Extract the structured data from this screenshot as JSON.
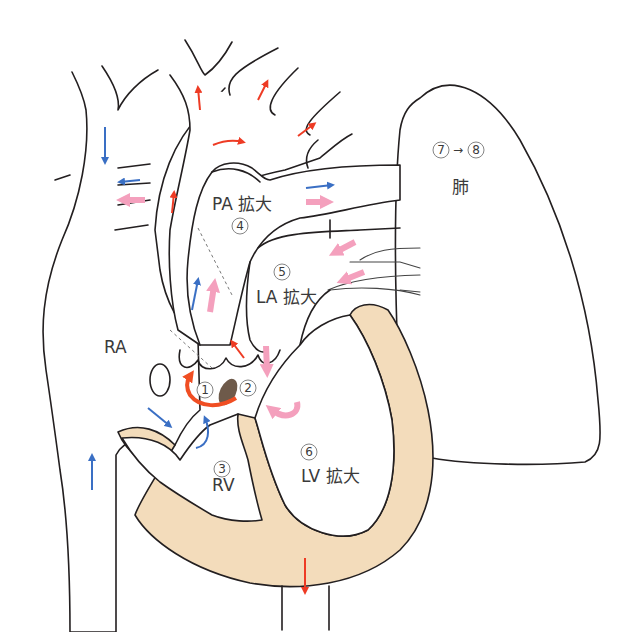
{
  "labels": {
    "ra": "RA",
    "pa": "PA 拡大",
    "la": "LA 拡大",
    "rv": "RV",
    "lv": "LV 拡大",
    "lung": "肺"
  },
  "markers": {
    "m1": "1",
    "m2": "2",
    "m3": "3",
    "m4": "4",
    "m5": "5",
    "m6": "6",
    "m7": "7",
    "m8": "8",
    "arrow": "→"
  },
  "colors": {
    "venous_blue": "#3a6fc4",
    "arterial_red": "#ee3b24",
    "shunt_pink": "#f4a0bd",
    "myocardium": "#f3dcbb",
    "shunt_orange": "#f04e23",
    "ductus_brown": "#6e5a4a"
  }
}
